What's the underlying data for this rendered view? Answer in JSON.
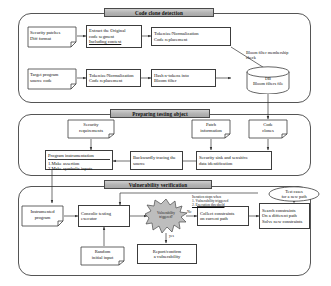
{
  "figure": {
    "colors": {
      "banner_fill": "#b9b9b9",
      "stroke": "#3c3c3c",
      "panel_stroke": "#555555",
      "burst_fill": "#bdbdbd",
      "background": "#ffffff"
    }
  },
  "sections": {
    "code_clone": {
      "banner": "Code clone detection"
    },
    "prepare": {
      "banner": "Preparing testing object"
    },
    "verify": {
      "banner": "Vulnerability verification"
    }
  },
  "code_clone": {
    "security_patches": {
      "line1": "Security patches",
      "line2": "Diff format"
    },
    "extract": {
      "line1": "Extract the Original",
      "line2": "code segment",
      "line3": "Including context"
    },
    "tokenize_top": {
      "line1": "Tokenize/Normalization",
      "line2": "Code replacement"
    },
    "target_program": {
      "line1": "Target program",
      "line2": "source code"
    },
    "tokenize_bottom": {
      "line1": "Tokenize/Normalization",
      "line2": "Code replacement"
    },
    "hash": {
      "line1": "Hash n-tokens into",
      "line2": "Bloom filter"
    },
    "db": {
      "line1": "DB",
      "line2": "Bloom filters file"
    },
    "bloom_check": {
      "line1": "Bloom filter membership",
      "line2": "check"
    }
  },
  "prepare": {
    "security_requirements": {
      "line1": "Security",
      "line2": "requirements"
    },
    "patch_information": {
      "line1": "Patch",
      "line2": "information"
    },
    "code_clones": {
      "line1": "Code",
      "line2": "clones"
    },
    "security_sink": {
      "line1": "Security sink and sensitive",
      "line2": "data identification"
    },
    "backward_trace": {
      "line1": "Backwardly tracing the",
      "line2": "source"
    },
    "instrumentation": {
      "header": "Program instrumentation",
      "item1": "1.Make assertion",
      "item2": "2.Make symbolic inputs"
    }
  },
  "verify": {
    "instrumented_program": {
      "line1": "Instrumented",
      "line2": "program"
    },
    "concolic_executor": {
      "line1": "Concolic testing",
      "line2": "executor"
    },
    "random_input": {
      "line1": "Random",
      "line2": "initial input"
    },
    "decision": {
      "line1": "Vulnerability",
      "line2": "triggered?"
    },
    "report": {
      "line1": "Report/confirm",
      "line2": "a vulnerability"
    },
    "collect_constraints": {
      "line1": "Collect constraints",
      "line2": "on current path"
    },
    "search_constraints": {
      "line1": "Search constraints",
      "line2": "On a different path",
      "line3": "Solve new constraints"
    },
    "test_cases": {
      "line1": "Test cases",
      "line2": "for a new path"
    },
    "iteration_note": {
      "line1": "Iteration stops when",
      "line2": "1.    Vulnerability triggered",
      "line3": "2.    Execution threshold"
    },
    "edge_yes": "yes",
    "edge_no": "No"
  }
}
